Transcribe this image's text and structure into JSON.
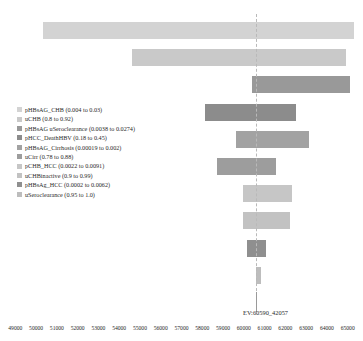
{
  "chart_data": {
    "type": "bar",
    "subtype": "tornado-sensitivity",
    "title": "",
    "xlabel": "",
    "ylabel": "",
    "xlim": [
      48600,
      65400
    ],
    "grid": false,
    "legend_position": "inside-left",
    "reference_line": {
      "label": "EV:60590_42057",
      "value": 60590.42057
    },
    "ticks": [
      49000,
      50000,
      51000,
      52000,
      53000,
      54000,
      55000,
      56000,
      57000,
      58000,
      59000,
      60000,
      61000,
      62000,
      63000,
      64000,
      65000
    ],
    "tick_labels": [
      "49000",
      "50000",
      "51000",
      "52000",
      "53000",
      "54000",
      "55000",
      "56000",
      "57000",
      "58000",
      "59000",
      "60000",
      "61000",
      "62000",
      "63000",
      "64000",
      "65000"
    ],
    "categories": [
      "pHBsAG_CHB (0.004 to 0.03)",
      "uCHB (0.8 to 0.92)",
      "pHBsAG uSeroclearance (0.0038 to 0.0274)",
      "pHCC_DeathHBV (0.18 to 0.45)",
      "pHBsAG_Cirrhosis (0.00019 to 0.002)",
      "uCirr (0.78 to 0.88)",
      "pCHB_HCC (0.0022 to 0.0091)",
      "uCHBinactive (0.9 to 0.99)",
      "pHBsAg_HCC (0.0002 to 0.0062)",
      "uSeroclearance (0.95 to 1.0)"
    ],
    "bars": [
      {
        "label": "pHBsAG_CHB (0.004 to 0.03)",
        "low": 50330,
        "high": 65300,
        "color": "#d3d3d3"
      },
      {
        "label": "uCHB (0.8 to 0.92)",
        "low": 54620,
        "high": 64940,
        "color": "#c9c9c9"
      },
      {
        "label": "pHBsAG uSeroclearance (0.0038 to 0.0274)",
        "low": 60380,
        "high": 65090,
        "color": "#999999"
      },
      {
        "label": "pHCC_DeathHBV (0.18 to 0.45)",
        "low": 58140,
        "high": 62530,
        "color": "#8c8c8c"
      },
      {
        "label": "pHBsAG_Cirrhosis (0.00019 to 0.002)",
        "low": 59620,
        "high": 63150,
        "color": "#a2a2a2"
      },
      {
        "label": "uCirr (0.78 to 0.88)",
        "low": 58710,
        "high": 61560,
        "color": "#9d9d9d"
      },
      {
        "label": "pCHB_HCC (0.0022 to 0.0091)",
        "low": 59970,
        "high": 62300,
        "color": "#c6c6c6"
      },
      {
        "label": "uCHBinactive (0.9 to 0.99)",
        "low": 59940,
        "high": 62200,
        "color": "#c2c2c2"
      },
      {
        "label": "pHBsAg_HCC (0.0002 to 0.0062)",
        "low": 60130,
        "high": 61050,
        "color": "#8f8f8f"
      },
      {
        "label": "uSeroclearance (0.95 to 1.0)",
        "low": 60590,
        "high": 60590,
        "color": "#bdbdbd"
      }
    ]
  },
  "legend": {
    "items": [
      {
        "label": "pHBsAG_CHB (0.004 to 0.03)",
        "color": "#d3d3d3"
      },
      {
        "label": "uCHB (0.8 to 0.92)",
        "color": "#c9c9c9"
      },
      {
        "label": "pHBsAG uSeroclearance (0.0038 to 0.0274)",
        "color": "#999999"
      },
      {
        "label": "pHCC_DeathHBV (0.18 to 0.45)",
        "color": "#8c8c8c"
      },
      {
        "label": "pHBsAG_Cirrhosis (0.00019 to 0.002)",
        "color": "#a2a2a2"
      },
      {
        "label": "uCirr (0.78 to 0.88)",
        "color": "#9d9d9d"
      },
      {
        "label": "pCHB_HCC (0.0022 to 0.0091)",
        "color": "#c6c6c6"
      },
      {
        "label": "uCHBinactive (0.9 to 0.99)",
        "color": "#c2c2c2"
      },
      {
        "label": "pHBsAg_HCC (0.0002 to 0.0062)",
        "color": "#8f8f8f"
      },
      {
        "label": "uSeroclearance (0.95 to 1.0)",
        "color": "#bdbdbd"
      }
    ]
  }
}
